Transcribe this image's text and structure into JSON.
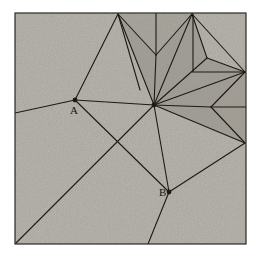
{
  "figure": {
    "frame": {
      "x": 15,
      "y": 13,
      "width": 231,
      "height": 231,
      "fill_color": "#a8a49c",
      "stroke_color": "#2b2822",
      "stroke_width": 1.2
    },
    "background_color": "#ffffff",
    "line_color": "#1d1a16",
    "line_width": 1.1,
    "shade_regions": [
      {
        "name": "upper-dark-fan",
        "points": "118,14 156,55 192,14 207,58 245,72 211,107 245,143 154,105",
        "fill": "#928e86",
        "opacity": 0.55
      },
      {
        "name": "notch-dark-wedge",
        "points": "245,72 211,107 245,143",
        "fill": "#8d8981",
        "opacity": 0.45
      },
      {
        "name": "upper-v-shadow",
        "points": "118,14 192,14 156,55",
        "fill": "#8f8b83",
        "opacity": 0.35
      }
    ],
    "vertices": [
      {
        "name": "point-A",
        "label": "A",
        "x": 75,
        "y": 100,
        "dot": true,
        "label_dx": -2,
        "label_dy": 13
      },
      {
        "name": "point-B",
        "label": "B",
        "x": 169,
        "y": 192,
        "dot": true,
        "label_dx": -10,
        "label_dy": 3
      },
      {
        "name": "hub-center",
        "label": "",
        "x": 154,
        "y": 105,
        "dot": true,
        "label_dx": 0,
        "label_dy": 0
      },
      {
        "name": "apex-top-left",
        "label": "",
        "x": 118,
        "y": 14,
        "dot": false,
        "label_dx": 0,
        "label_dy": 0
      },
      {
        "name": "apex-top-right",
        "label": "",
        "x": 192,
        "y": 14,
        "dot": false,
        "label_dx": 0,
        "label_dy": 0
      },
      {
        "name": "v-notch-top",
        "label": "",
        "x": 156,
        "y": 55,
        "dot": false,
        "label_dx": 0,
        "label_dy": 0
      },
      {
        "name": "inner-right-upper",
        "label": "",
        "x": 207,
        "y": 58,
        "dot": false,
        "label_dx": 0,
        "label_dy": 0
      },
      {
        "name": "edge-right-upper",
        "label": "",
        "x": 245,
        "y": 72,
        "dot": false,
        "label_dx": 0,
        "label_dy": 0
      },
      {
        "name": "notch-reflex",
        "label": "",
        "x": 211,
        "y": 107,
        "dot": false,
        "label_dx": 0,
        "label_dy": 0
      },
      {
        "name": "edge-right-lower",
        "label": "",
        "x": 245,
        "y": 143,
        "dot": false,
        "label_dx": 0,
        "label_dy": 0
      }
    ],
    "segments": [
      {
        "name": "seg-apexL-to-A",
        "x1": 118,
        "y1": 14,
        "x2": 75,
        "y2": 100
      },
      {
        "name": "seg-apexL-to-vnotch",
        "x1": 118,
        "y1": 14,
        "x2": 156,
        "y2": 55
      },
      {
        "name": "seg-apexL-to-center",
        "x1": 118,
        "y1": 14,
        "x2": 154,
        "y2": 105
      },
      {
        "name": "seg-apexL-to-mid",
        "x1": 118,
        "y1": 14,
        "x2": 140,
        "y2": 90
      },
      {
        "name": "seg-vertical-top-center",
        "x1": 156,
        "y1": 13,
        "x2": 156,
        "y2": 55
      },
      {
        "name": "seg-apexR-to-vnotch",
        "x1": 192,
        "y1": 14,
        "x2": 156,
        "y2": 55
      },
      {
        "name": "seg-apexR-to-center",
        "x1": 192,
        "y1": 14,
        "x2": 154,
        "y2": 105
      },
      {
        "name": "seg-apexR-to-innerR",
        "x1": 192,
        "y1": 14,
        "x2": 207,
        "y2": 58
      },
      {
        "name": "seg-apexR-to-edgeRU",
        "x1": 192,
        "y1": 14,
        "x2": 245,
        "y2": 72
      },
      {
        "name": "seg-vnotch-to-center",
        "x1": 156,
        "y1": 55,
        "x2": 154,
        "y2": 105
      },
      {
        "name": "seg-innerR-to-center",
        "x1": 207,
        "y1": 58,
        "x2": 154,
        "y2": 105
      },
      {
        "name": "seg-innerR-to-edgeRU",
        "x1": 207,
        "y1": 58,
        "x2": 245,
        "y2": 72
      },
      {
        "name": "seg-innerR-vertical",
        "x1": 193,
        "y1": 14,
        "x2": 193,
        "y2": 72
      },
      {
        "name": "seg-innerR-horizontal",
        "x1": 193,
        "y1": 72,
        "x2": 245,
        "y2": 72
      },
      {
        "name": "seg-edgeRU-to-center",
        "x1": 245,
        "y1": 72,
        "x2": 154,
        "y2": 105
      },
      {
        "name": "seg-edgeRU-to-reflex",
        "x1": 245,
        "y1": 72,
        "x2": 211,
        "y2": 107
      },
      {
        "name": "seg-reflex-to-center",
        "x1": 211,
        "y1": 107,
        "x2": 154,
        "y2": 105
      },
      {
        "name": "seg-reflex-to-edgeRL",
        "x1": 211,
        "y1": 107,
        "x2": 245,
        "y2": 143
      },
      {
        "name": "seg-reflex-horizontal",
        "x1": 211,
        "y1": 107,
        "x2": 246,
        "y2": 107
      },
      {
        "name": "seg-edgeRL-to-center",
        "x1": 245,
        "y1": 143,
        "x2": 154,
        "y2": 105
      },
      {
        "name": "seg-edgeRL-to-B",
        "x1": 245,
        "y1": 143,
        "x2": 169,
        "y2": 192
      },
      {
        "name": "seg-center-to-A",
        "x1": 154,
        "y1": 105,
        "x2": 75,
        "y2": 100
      },
      {
        "name": "seg-center-to-B",
        "x1": 154,
        "y1": 105,
        "x2": 169,
        "y2": 192
      },
      {
        "name": "seg-center-to-bottomleft",
        "x1": 154,
        "y1": 105,
        "x2": 16,
        "y2": 243
      },
      {
        "name": "seg-A-to-leftedge",
        "x1": 75,
        "y1": 100,
        "x2": 15,
        "y2": 113
      },
      {
        "name": "seg-A-to-B",
        "x1": 75,
        "y1": 100,
        "x2": 169,
        "y2": 192
      },
      {
        "name": "seg-B-to-bottomedge",
        "x1": 169,
        "y1": 192,
        "x2": 148,
        "y2": 244
      }
    ],
    "labels": [
      {
        "name": "label-A",
        "text": "A",
        "x": 70,
        "y": 114
      },
      {
        "name": "label-B",
        "text": "B",
        "x": 159,
        "y": 196
      }
    ]
  }
}
